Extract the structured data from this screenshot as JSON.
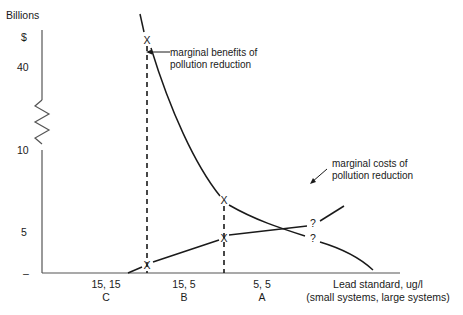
{
  "y_axis": {
    "unit_label": "Billions",
    "currency_label": "$",
    "ticks": [
      "40",
      "10",
      "5",
      "–"
    ],
    "break_symbol": "axis-break-zigzag"
  },
  "x_axis": {
    "title_line1": "Lead standard, ug/l",
    "title_line2": "(small systems, large systems)",
    "ticks": [
      {
        "values": "15, 15",
        "option": "C"
      },
      {
        "values": "15, 5",
        "option": "B"
      },
      {
        "values": "5, 5",
        "option": "A"
      }
    ]
  },
  "curves": {
    "benefits": {
      "label_line1": "marginal benefits of",
      "label_line2": "pollution reduction"
    },
    "costs": {
      "label_line1": "marginal costs of",
      "label_line2": "pollution reduction"
    }
  },
  "markers": {
    "x_mark": "X",
    "unknown_mark": "?"
  }
}
